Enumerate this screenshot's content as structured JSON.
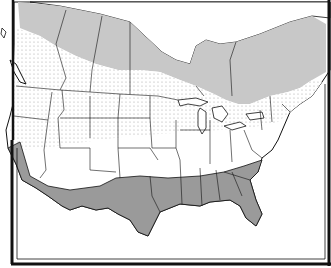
{
  "map": {
    "title": "",
    "region": "United States and southern Canada",
    "zones": [
      {
        "name": "northern-zone",
        "fill": "#c8c8c8",
        "pattern": "solid-light-gray"
      },
      {
        "name": "transition-zone",
        "fill": "#ffffff",
        "pattern": "dotted"
      },
      {
        "name": "central-zone",
        "fill": "#ffffff",
        "pattern": "plain"
      },
      {
        "name": "southern-zone",
        "fill": "#999999",
        "pattern": "solid-dark-gray"
      }
    ],
    "colors": {
      "light_gray": "#c8c8c8",
      "dark_gray": "#9a9a9a",
      "border": "#111111",
      "background": "#ffffff",
      "dot": "#a8a8a8"
    },
    "labels": []
  }
}
